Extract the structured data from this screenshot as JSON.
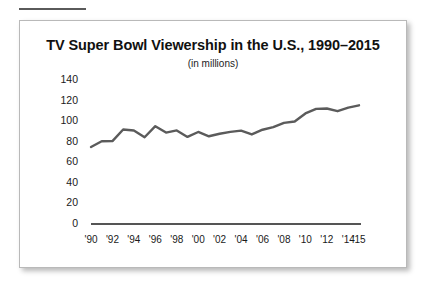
{
  "figure": {
    "title": "TV Super Bowl Viewership in the U.S., 1990–2015",
    "subtitle": "(in millions)",
    "line_color": "#5b5b5b",
    "axis_color": "#555555",
    "text_color": "#1a1a1a",
    "card_border_color": "#b9b9b9",
    "background": "#ffffff"
  },
  "chart_data": {
    "type": "line",
    "title": "TV Super Bowl Viewership in the U.S., 1990–2015",
    "subtitle": "(in millions)",
    "xlabel": "",
    "ylabel": "",
    "ylim": [
      0,
      140
    ],
    "yticks": [
      0,
      20,
      40,
      60,
      80,
      100,
      120,
      140
    ],
    "ytick_labels": [
      "0",
      "20",
      "40",
      "60",
      "80",
      "100",
      "120",
      "140"
    ],
    "grid": false,
    "legend": "none",
    "xtick_labels": [
      "'90",
      "'92",
      "'94",
      "'96",
      "'98",
      "'00",
      "'02",
      "'04",
      "'06",
      "'08",
      "'10",
      "'12",
      "'14",
      "'15"
    ],
    "xtick_years": [
      1990,
      1992,
      1994,
      1996,
      1998,
      2000,
      2002,
      2004,
      2006,
      2008,
      2010,
      2012,
      2014,
      2015
    ],
    "x": [
      1990,
      1991,
      1992,
      1993,
      1994,
      1995,
      1996,
      1997,
      1998,
      1999,
      2000,
      2001,
      2002,
      2003,
      2004,
      2005,
      2006,
      2007,
      2008,
      2009,
      2010,
      2011,
      2012,
      2013,
      2014,
      2015
    ],
    "values": [
      73.9,
      79.5,
      79.6,
      90.9,
      90.0,
      83.4,
      94.1,
      87.9,
      90.0,
      83.7,
      88.5,
      84.3,
      86.8,
      88.6,
      89.8,
      86.1,
      90.7,
      93.2,
      97.4,
      98.7,
      106.5,
      111.0,
      111.3,
      108.7,
      112.2,
      114.4
    ],
    "series_name": "Super Bowl viewership (millions)"
  },
  "plot_geometry": {
    "baseline_y_label": "0",
    "top_tick_label": "140"
  }
}
